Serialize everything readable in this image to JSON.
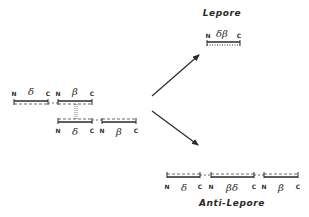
{
  "titles": {
    "lepore": "Lepore",
    "anti_lepore": "Anti-Lepore"
  },
  "chromosomes": {
    "top": {
      "labels": [
        "N",
        "δ",
        "C",
        "N",
        "β",
        "C"
      ]
    },
    "bottom": {
      "labels": [
        "N",
        "δ",
        "C",
        "N",
        "β",
        "C"
      ]
    },
    "lepore": {
      "labels": [
        "N",
        "δβ",
        "C"
      ]
    },
    "anti_lepore": {
      "labels": [
        "N",
        "δ",
        "C",
        "N",
        "βδ",
        "C",
        "N",
        "β",
        "C"
      ]
    }
  },
  "colors": {
    "ink": "#2a2a2a"
  }
}
